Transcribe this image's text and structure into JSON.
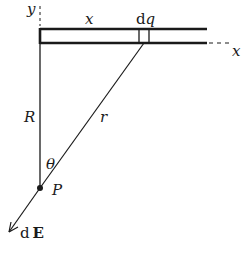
{
  "diagram": {
    "labels": {
      "y_axis": "y",
      "x_axis": "x",
      "x_distance": "x",
      "charge_element_d": "d",
      "charge_element_q": "q",
      "R": "R",
      "r": "r",
      "theta": "θ",
      "point": "P",
      "field_d": "d",
      "field_E": "E"
    },
    "colors": {
      "ink": "#1a1a1a",
      "background": "#ffffff"
    }
  }
}
